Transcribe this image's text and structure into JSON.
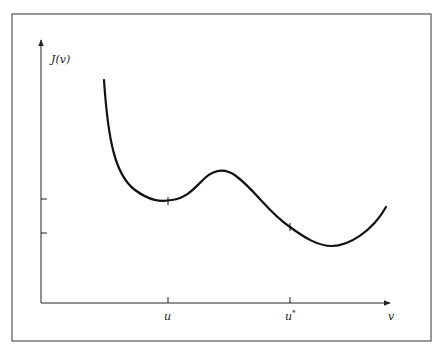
{
  "figure": {
    "y_axis_label": "J(v)",
    "x_axis_label": "v",
    "x_ticks": [
      {
        "label": "u",
        "x": 168
      },
      {
        "label": "u",
        "superscript": "*",
        "x": 290
      }
    ],
    "y_ticks": [
      {
        "y": 200
      },
      {
        "y": 233
      }
    ],
    "curve_description": "Function J(v) with local minimum at u and global minimum near u*",
    "colors": {
      "line": "#111111",
      "frame": "#555555",
      "background": "#ffffff"
    }
  }
}
